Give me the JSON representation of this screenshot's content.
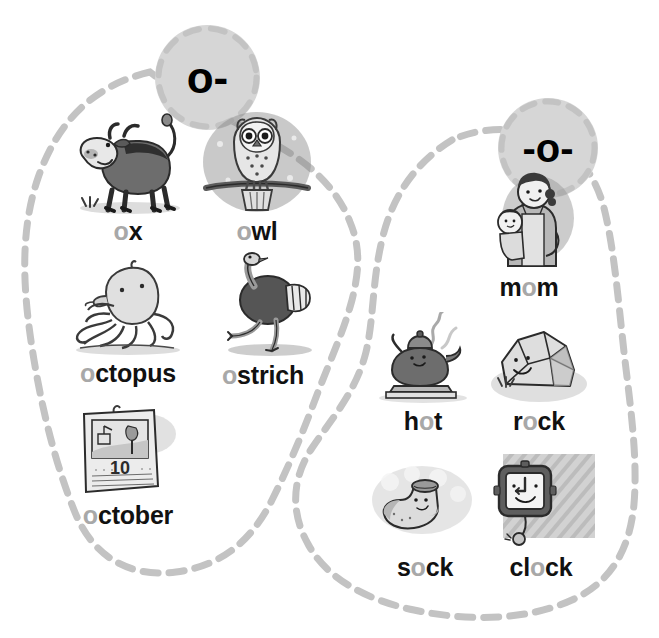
{
  "page": {
    "background_color": "#ffffff",
    "blob_outline_color": "#c3c3c3",
    "circle_fill_color": "#d6d6d6",
    "highlight_letter_color": "#a8a8a8",
    "word_text_color": "#111111"
  },
  "groups": [
    {
      "id": "group-initial-o",
      "label": "o-",
      "label_font_size": "44px",
      "items": [
        {
          "id": "ox",
          "word": "ox",
          "highlight_prefix": "o",
          "highlight_middle": "",
          "rest": "x",
          "icon": "ox-illustration",
          "x": 64,
          "y": 112,
          "w": 128,
          "h": 104,
          "label_x": 64,
          "label_y": 214,
          "label_w": 128
        },
        {
          "id": "owl",
          "word": "owl",
          "highlight_prefix": "o",
          "highlight_middle": "",
          "rest": "wl",
          "icon": "owl-illustration",
          "x": 198,
          "y": 108,
          "w": 118,
          "h": 108,
          "label_x": 193,
          "label_y": 214,
          "label_w": 128
        },
        {
          "id": "octopus",
          "word": "octopus",
          "highlight_prefix": "o",
          "highlight_middle": "",
          "rest": "ctopus",
          "icon": "octopus-illustration",
          "x": 64,
          "y": 258,
          "w": 124,
          "h": 100,
          "label_x": 54,
          "label_y": 356,
          "label_w": 148
        },
        {
          "id": "ostrich",
          "word": "ostrich",
          "highlight_prefix": "o",
          "highlight_middle": "",
          "rest": "strich",
          "icon": "ostrich-illustration",
          "x": 200,
          "y": 252,
          "w": 118,
          "h": 108,
          "label_x": 198,
          "label_y": 356,
          "label_w": 130
        },
        {
          "id": "october",
          "word": "october",
          "highlight_prefix": "o",
          "highlight_middle": "",
          "rest": "ctober",
          "icon": "calendar-illustration",
          "x": 68,
          "y": 400,
          "w": 116,
          "h": 100,
          "label_x": 54,
          "label_y": 496,
          "label_w": 148
        }
      ]
    },
    {
      "id": "group-medial-o",
      "label": "-o-",
      "label_font_size": "40px",
      "items": [
        {
          "id": "mom",
          "word": "mom",
          "highlight_prefix": "",
          "highlight_middle": "o",
          "before": "m",
          "rest": "m",
          "icon": "mom-illustration",
          "x": 472,
          "y": 170,
          "w": 114,
          "h": 102,
          "label_x": 462,
          "label_y": 268,
          "label_w": 134
        },
        {
          "id": "hot",
          "word": "hot",
          "highlight_prefix": "",
          "highlight_middle": "o",
          "before": "h",
          "rest": "t",
          "icon": "kettle-illustration",
          "x": 372,
          "y": 312,
          "w": 110,
          "h": 94,
          "label_x": 368,
          "label_y": 406,
          "label_w": 110
        },
        {
          "id": "rock",
          "word": "rock",
          "highlight_prefix": "",
          "highlight_middle": "o",
          "before": "r",
          "rest": "ck",
          "icon": "rock-illustration",
          "x": 484,
          "y": 312,
          "w": 110,
          "h": 94,
          "label_x": 482,
          "label_y": 406,
          "label_w": 114
        },
        {
          "id": "sock",
          "word": "sock",
          "highlight_prefix": "",
          "highlight_middle": "o",
          "before": "s",
          "rest": "ck",
          "icon": "sock-illustration",
          "x": 370,
          "y": 456,
          "w": 114,
          "h": 96,
          "label_x": 366,
          "label_y": 552,
          "label_w": 118
        },
        {
          "id": "clock",
          "word": "clock",
          "highlight_prefix": "",
          "highlight_middle": "o",
          "before": "cl",
          "rest": "ck",
          "icon": "clock-illustration",
          "x": 482,
          "y": 452,
          "w": 112,
          "h": 100,
          "label_x": 478,
          "label_y": 552,
          "label_w": 126
        }
      ]
    }
  ]
}
